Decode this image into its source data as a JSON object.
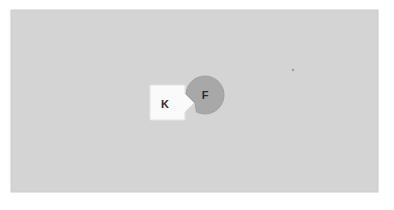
{
  "canvas": {
    "width": 394,
    "height": 210,
    "outer_background": "#ffffff",
    "panel": {
      "name": "diagram-panel",
      "x": 11,
      "y": 10,
      "width": 367,
      "height": 182,
      "fill": "#d4d4d4",
      "stroke": "#cccccc"
    }
  },
  "shapes": [
    {
      "id": "square-k",
      "kind": "square-with-tab",
      "label": "K",
      "fill": "#fafafa",
      "stroke": "#e3e3e3",
      "x": 150,
      "y": 85,
      "width": 35,
      "height": 35,
      "label_x": 165,
      "label_y": 104,
      "label_size": 11,
      "tab": {
        "side": "right",
        "center_y": 103,
        "depth": 9,
        "half_height": 9
      }
    },
    {
      "id": "circle-f",
      "kind": "circle-with-notch",
      "label": "F",
      "fill": "#a8a8a8",
      "stroke": "#a0a0a0",
      "cx": 205,
      "cy": 95,
      "r": 19,
      "label_x": 205,
      "label_y": 95,
      "label_size": 11,
      "notch": {
        "side": "left",
        "center_y": 103,
        "depth": 9,
        "half_height": 9
      }
    }
  ],
  "markers": [
    {
      "id": "dot-marker",
      "x": 293,
      "y": 70,
      "r": 1.2,
      "fill": "#9a9a9a"
    }
  ]
}
